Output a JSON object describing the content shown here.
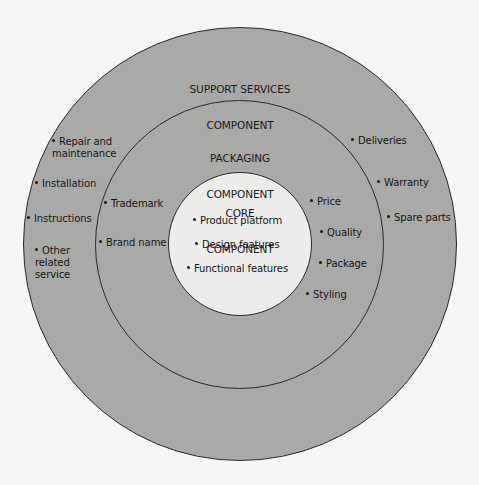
{
  "diagram": {
    "type": "concentric-circles",
    "colors": {
      "background": "#f6f6f4",
      "outer_ring": "#a9a9a7",
      "middle_ring": "#a9a9a7",
      "core": "#ececea",
      "stroke": "#2a2a2a",
      "text": "#1a1a1a"
    },
    "support": {
      "title_line1": "SUPPORT SERVICES",
      "title_line2": "COMPONENT",
      "left_items": [
        {
          "label": "Repair and\nmaintenance"
        },
        {
          "label": "Installation"
        },
        {
          "label": "Instructions"
        },
        {
          "label": "Other\nrelated\nservice"
        }
      ],
      "right_items": [
        {
          "label": "Deliveries"
        },
        {
          "label": "Warranty"
        },
        {
          "label": "Spare parts"
        }
      ]
    },
    "packaging": {
      "title_line1": "PACKAGING",
      "title_line2": "COMPONENT",
      "left_items": [
        {
          "label": "Trademark"
        },
        {
          "label": "Brand name"
        }
      ],
      "right_items": [
        {
          "label": "Price"
        },
        {
          "label": "Quality"
        },
        {
          "label": "Package"
        },
        {
          "label": "Styling"
        }
      ]
    },
    "core": {
      "title_line1": "CORE",
      "title_line2": "COMPONENT",
      "items": [
        {
          "label": "Product platform"
        },
        {
          "label": "Design features"
        },
        {
          "label": "Functional features"
        }
      ]
    }
  }
}
